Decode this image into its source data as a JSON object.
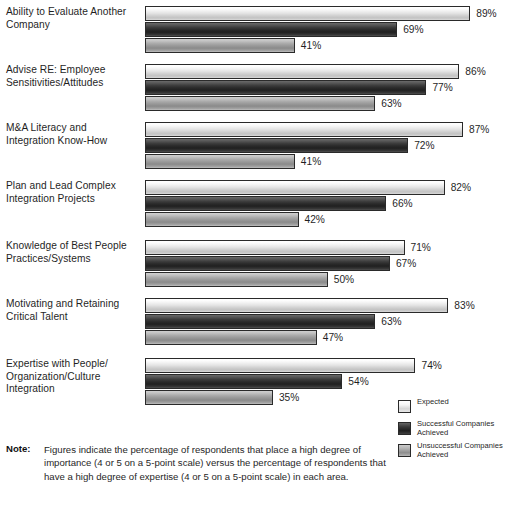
{
  "chart_data": {
    "type": "bar",
    "orientation": "horizontal",
    "title": "",
    "xlabel": "",
    "ylabel": "",
    "xlim": [
      0,
      100
    ],
    "grid": false,
    "value_suffix": "%",
    "legend_position": "bottom-right",
    "categories": [
      "Ability to Evaluate Another Company",
      "Advise RE: Employee Sensitivities/Attitudes",
      "M&A Literacy and Integration Know-How",
      "Plan and Lead Complex Integration Projects",
      "Knowledge of Best People Practices/Systems",
      "Motivating and Retaining Critical Talent",
      "Expertise with People/Organization/Culture Integration"
    ],
    "category_lines": [
      [
        "Ability to Evaluate Another",
        "Company"
      ],
      [
        "Advise RE: Employee",
        "Sensitivities/Attitudes"
      ],
      [
        "M&A Literacy and",
        "Integration Know-How"
      ],
      [
        "Plan and Lead Complex",
        "Integration Projects"
      ],
      [
        "Knowledge of Best People",
        "Practices/Systems"
      ],
      [
        "Motivating and Retaining",
        "Critical Talent"
      ],
      [
        "Expertise with People/",
        "Organization/Culture",
        "Integration"
      ]
    ],
    "series": [
      {
        "name": "Expected",
        "key": "expected",
        "color": "#e2e2e2",
        "values": [
          89,
          86,
          87,
          82,
          71,
          83,
          74
        ],
        "labels": [
          "89%",
          "86%",
          "87%",
          "82%",
          "71%",
          "83%",
          "74%"
        ]
      },
      {
        "name": "Successful Companies Achieved",
        "key": "successful",
        "color": "#2b2b2b",
        "values": [
          69,
          77,
          72,
          66,
          67,
          63,
          54
        ],
        "labels": [
          "69%",
          "77%",
          "72%",
          "66%",
          "67%",
          "63%",
          "54%"
        ]
      },
      {
        "name": "Unsuccessful Companies Achieved",
        "key": "unsuccessful",
        "color": "#999999",
        "values": [
          41,
          63,
          41,
          42,
          50,
          47,
          35
        ],
        "labels": [
          "41%",
          "63%",
          "41%",
          "42%",
          "50%",
          "47%",
          "35%"
        ]
      }
    ]
  },
  "legend": {
    "items": [
      {
        "label": "Expected",
        "key": "expected",
        "lines": [
          "Expected"
        ]
      },
      {
        "label": "Successful Companies Achieved",
        "key": "successful",
        "lines": [
          "Successful Companies",
          "Achieved"
        ]
      },
      {
        "label": "Unsuccessful Companies Achieved",
        "key": "unsuccessful",
        "lines": [
          "Unsuccessful Companies",
          "Achieved"
        ]
      }
    ]
  },
  "note": {
    "label": "Note:",
    "text": "Figures indicate the percentage of respondents that place a high degree of importance (4 or 5 on a 5-point scale) versus the percentage of respondents that have a high degree of  expertise (4 or 5 on a 5-point scale) in each area."
  }
}
